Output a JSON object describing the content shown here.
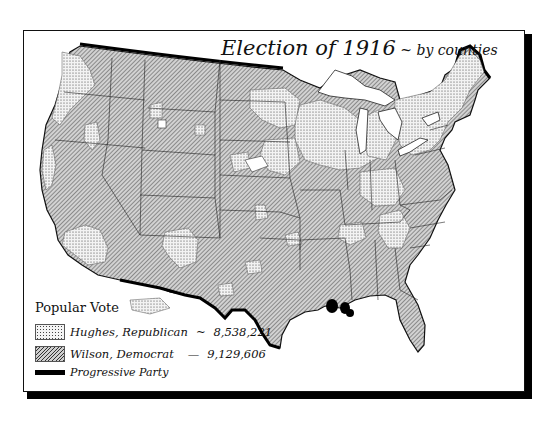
{
  "title": {
    "main": "Election of 1916",
    "separator": " ~ ",
    "sub": "by counties"
  },
  "legend": {
    "heading": "Popular Vote",
    "items": [
      {
        "label": "Hughes, Republican",
        "sep": "~",
        "votes": "8,538,221",
        "pattern": "stipple",
        "color": "#f4f4f4"
      },
      {
        "label": "Wilson, Democrat",
        "sep": "—",
        "votes": "9,129,606",
        "pattern": "diagonal-hatch",
        "color": "#cfcfcf"
      },
      {
        "label": "Progressive Party",
        "sep": "",
        "votes": "",
        "pattern": "solid",
        "color": "#000000"
      }
    ]
  },
  "map": {
    "region": "United States",
    "unit": "counties",
    "colors": {
      "republican": "#f4f4f4",
      "democrat": "#cfcfcf",
      "progressive": "#000000",
      "border": "#222222",
      "frame": "#111111"
    }
  }
}
